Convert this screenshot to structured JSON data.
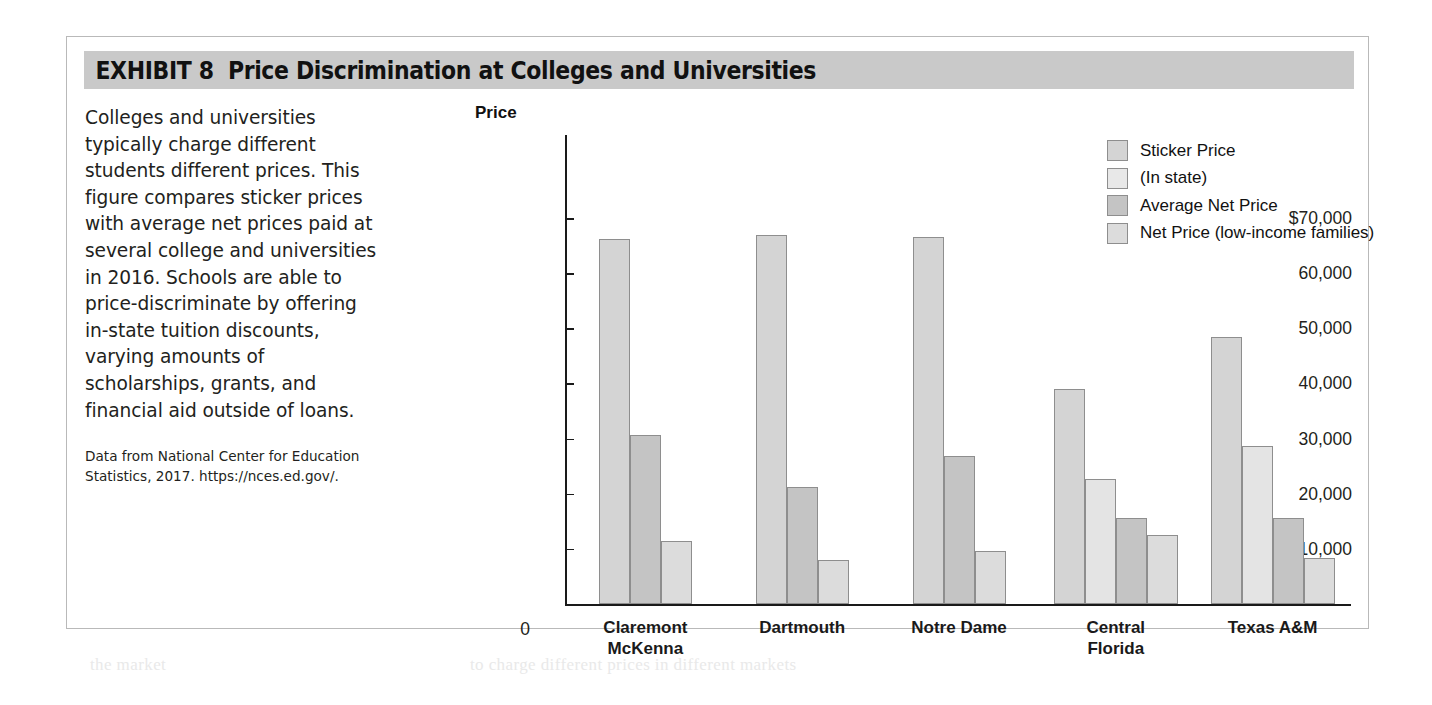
{
  "exhibit": {
    "number_label": "EXHIBIT 8",
    "title": "Price Discrimination at Colleges and Universities"
  },
  "caption": {
    "body": "Colleges and universities typically charge different students different prices. This figure compares sticker prices with average net prices paid at several college and universities in 2016. Schools are able to price-discriminate by offering in-state tuition discounts, varying amounts of scholarships, grants, and financial aid outside of loans.",
    "source": "Data from National Center for Education Statistics, 2017. https://nces.ed.gov/."
  },
  "chart_data": {
    "type": "bar",
    "title": "Price Discrimination at Colleges and Universities",
    "xlabel": "",
    "ylabel": "Price",
    "axis_title": "Price",
    "ylim": [
      0,
      70000
    ],
    "grid": false,
    "legend_position": "top-right",
    "ytick_labels": [
      "$70,000",
      "60,000",
      "50,000",
      "40,000",
      "30,000",
      "20,000",
      "10,000"
    ],
    "ytick_values": [
      70000,
      60000,
      50000,
      40000,
      30000,
      20000,
      10000
    ],
    "zero_label": "0",
    "categories": [
      "Claremont McKenna",
      "Dartmouth",
      "Notre Dame",
      "Central Florida",
      "Texas A&M"
    ],
    "category_lines": [
      [
        "Claremont",
        "McKenna"
      ],
      [
        "Dartmouth"
      ],
      [
        "Notre Dame"
      ],
      [
        "Central",
        "Florida"
      ],
      [
        "Texas A&M"
      ]
    ],
    "series": [
      {
        "name": "Sticker Price",
        "color": "#d4d4d4",
        "values": [
          66200,
          67000,
          66600,
          38900,
          48500
        ]
      },
      {
        "name": "(In state)",
        "color": "#e4e4e4",
        "values": [
          null,
          null,
          null,
          22600,
          28700
        ]
      },
      {
        "name": "Average Net Price",
        "color": "#c4c4c4",
        "values": [
          30600,
          21300,
          26900,
          15600,
          15600
        ]
      },
      {
        "name": "Net Price (low-income families)",
        "color": "#dcdcdc",
        "values": [
          11500,
          8000,
          9700,
          12500,
          8300
        ]
      }
    ]
  },
  "legend": {
    "items": [
      {
        "label": "Sticker Price",
        "color": "#d4d4d4"
      },
      {
        "label": "(In state)",
        "color": "#e8e8e8"
      },
      {
        "label": "Average Net Price",
        "color": "#c4c4c4"
      },
      {
        "label": "Net Price (low-income families)",
        "color": "#dcdcdc"
      }
    ]
  },
  "colors": {
    "header_band": "#c9c9c9",
    "box_border": "#b9b9b9",
    "axis": "#1a1a1a",
    "bar_outline": "#8e8e8e"
  }
}
